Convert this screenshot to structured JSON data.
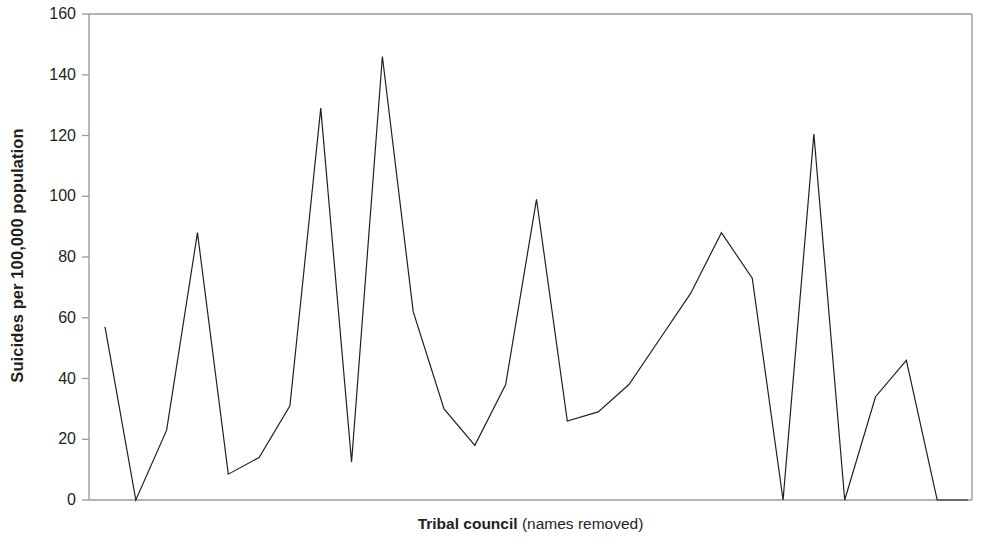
{
  "chart_data": {
    "type": "line",
    "title": "",
    "subtitle": "",
    "xlabel_bold": "Tribal council",
    "xlabel_plain": " (names removed)",
    "xlabel": "Tribal council (names removed)",
    "ylabel": "Suicides per 100,000 population",
    "ylim": [
      0,
      160
    ],
    "ytick_values": [
      0,
      20,
      40,
      60,
      80,
      100,
      120,
      140,
      160
    ],
    "ytick_labels": [
      "0",
      "20",
      "40",
      "60",
      "80",
      "100",
      "120",
      "140",
      "160"
    ],
    "xtick_labels": [],
    "grid": false,
    "legend": false,
    "legend_position": "none",
    "line_color": "#231f20",
    "line_width": 1.2,
    "axis_color": "#808080",
    "background_color": "#ffffff",
    "series": [
      {
        "name": "Suicide rate by tribal council",
        "values": [
          57,
          0,
          23,
          88,
          8.5,
          14,
          31,
          129,
          12.5,
          146,
          62,
          30,
          18,
          38,
          99,
          26,
          29,
          38,
          53,
          68,
          88,
          73,
          0,
          120.5,
          0,
          34,
          46,
          0,
          0
        ]
      }
    ],
    "x": [
      1,
      2,
      3,
      4,
      5,
      6,
      7,
      8,
      9,
      10,
      11,
      12,
      13,
      14,
      15,
      16,
      17,
      18,
      19,
      20,
      21,
      22,
      23,
      24,
      25,
      26,
      27,
      28,
      29
    ]
  },
  "axis": {
    "y_title": "Suicides per 100,000 population",
    "x_title_bold": "Tribal council",
    "x_title_plain": " (names removed)"
  }
}
